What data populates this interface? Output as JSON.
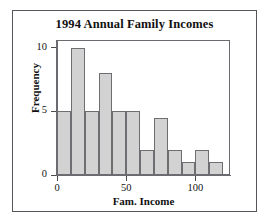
{
  "chart_data": {
    "type": "bar",
    "title": "1994 Annual Family Incomes",
    "xlabel": "Fam. Income",
    "ylabel": "Frequency",
    "xlim": [
      0,
      125
    ],
    "ylim": [
      0,
      10.6
    ],
    "grid": false,
    "legend": null,
    "bin_width": 10,
    "bin_edges": [
      0,
      10,
      20,
      30,
      40,
      50,
      60,
      70,
      80,
      90,
      100,
      110,
      120
    ],
    "categories": [
      "0-10",
      "10-20",
      "20-30",
      "30-40",
      "40-50",
      "50-60",
      "60-70",
      "70-80",
      "80-90",
      "90-100",
      "100-110",
      "110-120"
    ],
    "values": [
      5,
      10,
      5,
      8,
      5,
      5,
      2,
      4.5,
      2,
      1,
      2,
      1
    ],
    "x_ticks": [
      {
        "value": 0,
        "label": "0"
      },
      {
        "value": 50,
        "label": "50"
      },
      {
        "value": 100,
        "label": "100"
      }
    ],
    "y_ticks": [
      {
        "value": 0,
        "label": "0"
      },
      {
        "value": 5,
        "label": "5"
      },
      {
        "value": 10,
        "label": "10"
      }
    ],
    "bar_fill_color": "#d2d2d2",
    "bar_border_color": "#6e6e72",
    "axis_color": "#6a6a70",
    "frame_color": "#55555c",
    "text_color": "#111111",
    "background_color": "#ffffff"
  }
}
